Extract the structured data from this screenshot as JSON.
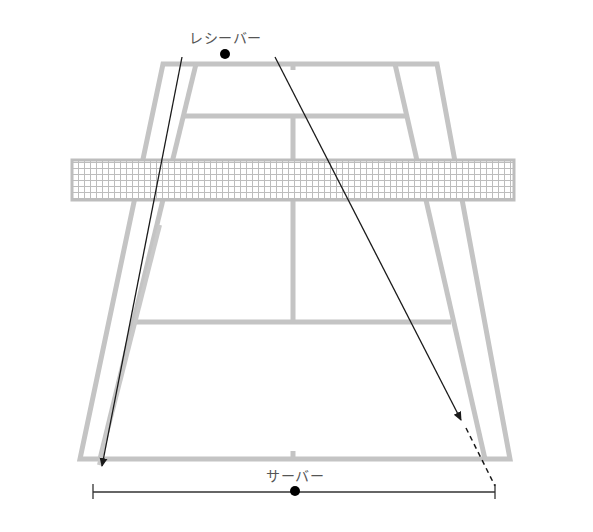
{
  "diagram": {
    "labels": {
      "receiver": "レシーバー",
      "server": "サーバー"
    },
    "colors": {
      "court_line": "#c4c4c4",
      "net": "#bdbdbd",
      "arrow": "#1a1a1a",
      "player_dot": "#000000",
      "label_text": "#555555"
    },
    "court": {
      "far_baseline_y": 64,
      "near_baseline_y": 459,
      "far_doubles_x": [
        163,
        437
      ],
      "near_doubles_x": [
        80,
        510
      ],
      "far_singles_x": [
        196,
        395
      ],
      "near_singles_x": [
        100,
        485
      ],
      "service_line_far_y": 116,
      "service_line_near_y": 322,
      "center_x": 293,
      "net": {
        "x1": 72,
        "x2": 514,
        "y1": 160,
        "y2": 200
      }
    },
    "players": {
      "receiver": {
        "x": 225,
        "y": 54
      },
      "server": {
        "x": 295,
        "y": 491
      }
    },
    "arrows": [
      {
        "name": "down-the-line-arrow",
        "from": [
          182,
          57
        ],
        "to": [
          101,
          470
        ],
        "style": "solid"
      },
      {
        "name": "cross-court-arrow",
        "from": [
          275,
          57
        ],
        "to": [
          461,
          419
        ],
        "style": "solid"
      },
      {
        "name": "cross-court-extension",
        "from": [
          463,
          423
        ],
        "to": [
          493,
          486
        ],
        "style": "dashed"
      },
      {
        "name": "inner-return-line",
        "from": [
          160,
          225
        ],
        "to": [
          101,
          470
        ],
        "style": "shadow"
      }
    ],
    "server_range": {
      "x1": 93,
      "x2": 493,
      "y": 492
    }
  }
}
